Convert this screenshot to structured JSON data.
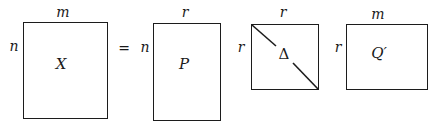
{
  "diagram": {
    "type": "matrix-factorization",
    "equation_symbol": "=",
    "matrices": [
      {
        "id": "X",
        "name": "X",
        "rows_label": "n",
        "cols_label": "m",
        "diagonal": false
      },
      {
        "id": "P",
        "name": "P",
        "rows_label": "n",
        "cols_label": "r",
        "diagonal": false
      },
      {
        "id": "Delta",
        "name": "Δ",
        "rows_label": "r",
        "cols_label": "r",
        "diagonal": true
      },
      {
        "id": "Qprime",
        "name": "Q′",
        "rows_label": "r",
        "cols_label": "m",
        "diagonal": false
      }
    ]
  },
  "colors": {
    "stroke": "#1c1c1c",
    "background": "#ffffff"
  }
}
